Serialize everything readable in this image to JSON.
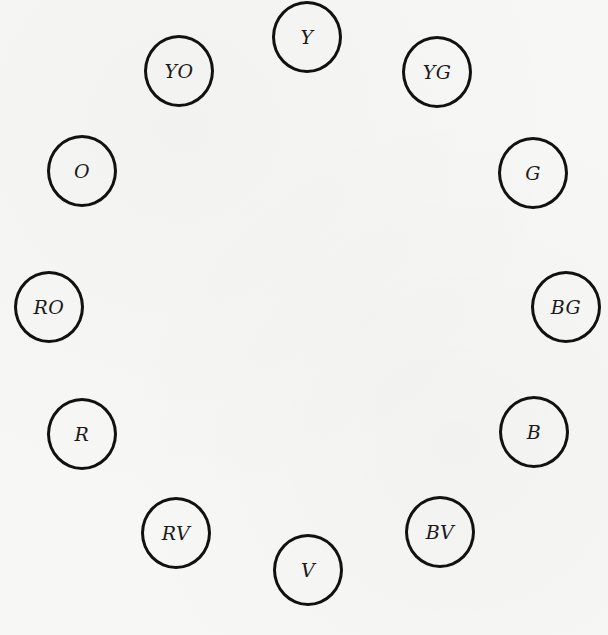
{
  "diagram": {
    "type": "color-wheel",
    "background_color": "#f7f7f5",
    "stroke_color": "#111111",
    "nodes": [
      {
        "label": "Y",
        "name": "yellow",
        "x": 307,
        "y": 37
      },
      {
        "label": "YG",
        "name": "yellow-green",
        "x": 437,
        "y": 72
      },
      {
        "label": "G",
        "name": "green",
        "x": 533,
        "y": 173
      },
      {
        "label": "BG",
        "name": "blue-green",
        "x": 566,
        "y": 307
      },
      {
        "label": "B",
        "name": "blue",
        "x": 534,
        "y": 432
      },
      {
        "label": "BV",
        "name": "blue-violet",
        "x": 440,
        "y": 532
      },
      {
        "label": "V",
        "name": "violet",
        "x": 308,
        "y": 570
      },
      {
        "label": "RV",
        "name": "red-violet",
        "x": 176,
        "y": 533
      },
      {
        "label": "R",
        "name": "red",
        "x": 82,
        "y": 434
      },
      {
        "label": "RO",
        "name": "red-orange",
        "x": 49,
        "y": 307
      },
      {
        "label": "O",
        "name": "orange",
        "x": 82,
        "y": 171
      },
      {
        "label": "YO",
        "name": "yellow-orange",
        "x": 179,
        "y": 71
      }
    ]
  }
}
